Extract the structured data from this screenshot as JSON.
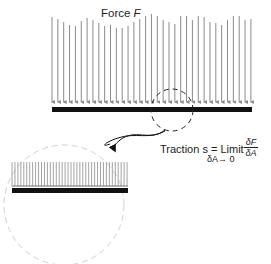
{
  "labels": {
    "force_prefix": "Force",
    "force_var": "F",
    "traction_text": "Traction s = Limit",
    "limit_sub": "δA→ 0",
    "frac_num": "δF",
    "frac_den": "δA"
  },
  "colors": {
    "arrow": "#8a8a8a",
    "bar": "#111111",
    "dashed": "#222222",
    "zoom_circle": "#cccccc"
  },
  "arrow_tops": [
    17,
    19,
    22,
    25,
    26,
    21,
    18,
    20,
    23,
    26,
    25,
    28,
    28,
    26,
    22,
    19,
    16,
    14,
    16,
    20,
    22,
    24,
    16,
    16,
    20,
    16,
    17,
    22,
    23,
    25,
    20,
    16,
    16,
    20,
    19
  ]
}
